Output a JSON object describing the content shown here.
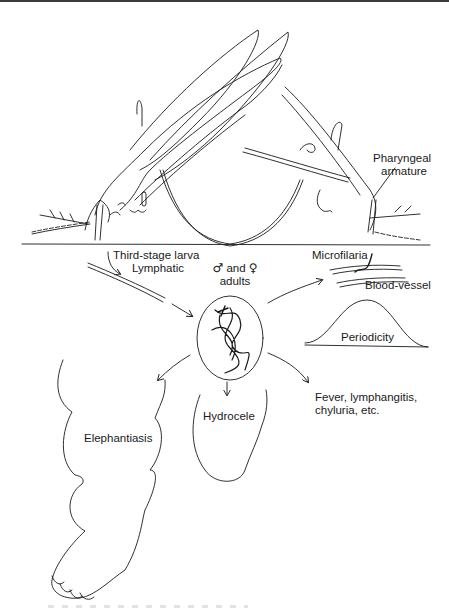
{
  "figure": {
    "stroke_color": "#1a1a1a",
    "background": "#ffffff",
    "labels": {
      "pharyngeal": [
        "Pharyngeal",
        "armature"
      ],
      "third_stage": "Third-stage larva",
      "lymphatic": "Lymphatic",
      "microfilaria": "Microfilaria",
      "blood_vessel": "Blood-vessel",
      "male_symbol": "♂",
      "and": "and",
      "female_symbol": "♀",
      "adults": "adults",
      "periodicity": "Periodicity",
      "elephantiasis": "Elephantiasis",
      "hydrocele": "Hydrocele",
      "fever": [
        "Fever, lymphangitis,",
        "chyluria, etc."
      ]
    }
  }
}
